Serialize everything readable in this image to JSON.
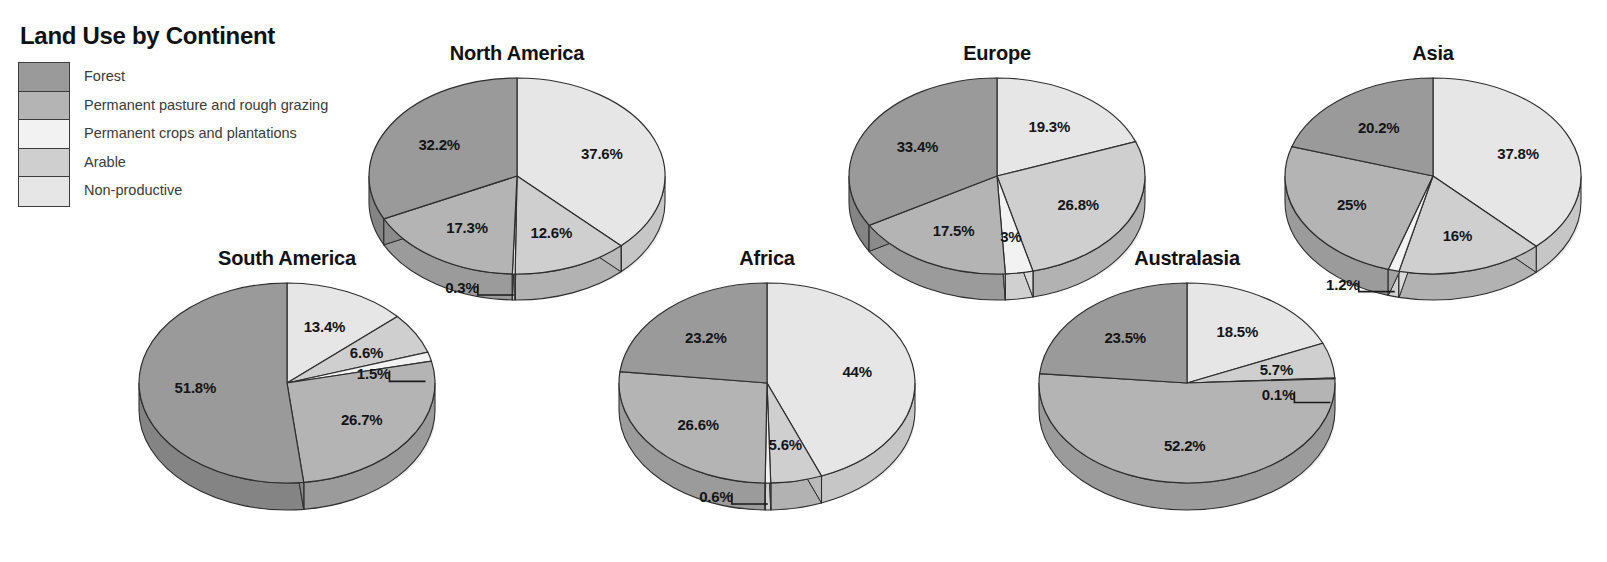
{
  "legend": {
    "title": "Land Use by Continent",
    "items": [
      {
        "label": "Forest",
        "color": "#9a9a9a"
      },
      {
        "label": "Permanent pasture and rough grazing",
        "color": "#b4b4b4"
      },
      {
        "label": "Permanent crops and plantations",
        "color": "#f2f2f2"
      },
      {
        "label": "Arable",
        "color": "#cfcfcf"
      },
      {
        "label": "Non-productive",
        "color": "#e6e6e6"
      }
    ]
  },
  "chart_data": {
    "type": "pie",
    "title": "Land Use by Continent",
    "units": "percent",
    "categories": [
      "Forest",
      "Permanent pasture and rough grazing",
      "Permanent crops and plantations",
      "Arable",
      "Non-productive"
    ],
    "colors": [
      "#9a9a9a",
      "#b4b4b4",
      "#f2f2f2",
      "#cfcfcf",
      "#e6e6e6"
    ],
    "charts": [
      {
        "name": "North America",
        "values": [
          32.2,
          17.3,
          0.3,
          12.6,
          37.6
        ],
        "labels": [
          "32.2%",
          "17.3%",
          "0.3%",
          "12.6%",
          "37.6%"
        ]
      },
      {
        "name": "Europe",
        "values": [
          33.4,
          17.5,
          3,
          26.8,
          19.3
        ],
        "labels": [
          "33.4%",
          "17.5%",
          "3%",
          "26.8%",
          "19.3%"
        ]
      },
      {
        "name": "Asia",
        "values": [
          20.2,
          25,
          1.2,
          16,
          37.8
        ],
        "labels": [
          "20.2%",
          "25%",
          "1.2%",
          "16%",
          "37.8%"
        ]
      },
      {
        "name": "South America",
        "values": [
          51.8,
          26.7,
          1.5,
          6.6,
          13.4
        ],
        "labels": [
          "51.8%",
          "26.7%",
          "1.5%",
          "6.6%",
          "13.4%"
        ]
      },
      {
        "name": "Africa",
        "values": [
          23.2,
          26.6,
          0.6,
          5.6,
          44
        ],
        "labels": [
          "23.2%",
          "26.6%",
          "0.6%",
          "5.6%",
          "44%"
        ]
      },
      {
        "name": "Australasia",
        "values": [
          23.5,
          52.2,
          0.1,
          5.7,
          18.5
        ],
        "labels": [
          "23.5%",
          "52.2%",
          "0.1%",
          "5.7%",
          "18.5%"
        ]
      }
    ]
  },
  "layout": {
    "charts": [
      {
        "key": "north-america",
        "x": 352,
        "y": 40,
        "w": 330,
        "h": 260,
        "rx": 148,
        "ry": 98,
        "depth": 26,
        "titleTop": 2
      },
      {
        "key": "europe",
        "x": 832,
        "y": 40,
        "w": 330,
        "h": 260,
        "rx": 148,
        "ry": 98,
        "depth": 26,
        "titleTop": 2
      },
      {
        "key": "asia",
        "x": 1268,
        "y": 40,
        "w": 330,
        "h": 260,
        "rx": 148,
        "ry": 98,
        "depth": 26,
        "titleTop": 2
      },
      {
        "key": "south-america",
        "x": 122,
        "y": 245,
        "w": 330,
        "h": 270,
        "rx": 148,
        "ry": 100,
        "depth": 27,
        "titleTop": 2
      },
      {
        "key": "africa",
        "x": 602,
        "y": 245,
        "w": 330,
        "h": 270,
        "rx": 148,
        "ry": 100,
        "depth": 27,
        "titleTop": 2
      },
      {
        "key": "australasia",
        "x": 1022,
        "y": 245,
        "w": 330,
        "h": 270,
        "rx": 148,
        "ry": 100,
        "depth": 27,
        "titleTop": 2
      }
    ]
  }
}
